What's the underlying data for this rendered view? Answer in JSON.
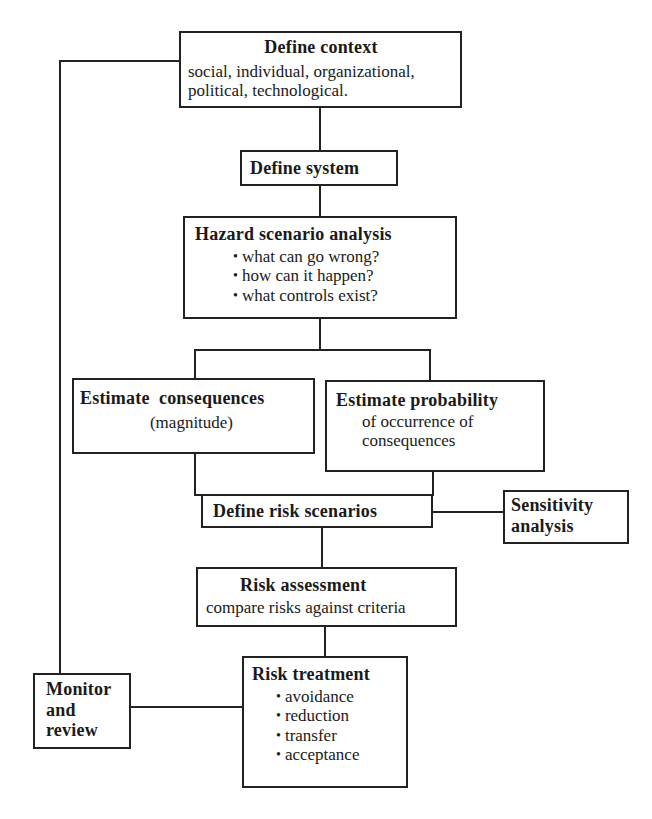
{
  "diagram": {
    "type": "flowchart",
    "nodes": {
      "define_context": {
        "title": "Define context",
        "text_line1": "social, individual, organizational,",
        "text_line2": "political, technological."
      },
      "define_system": {
        "title": "Define system"
      },
      "hazard_analysis": {
        "title": "Hazard scenario analysis",
        "bullets": [
          "what can go wrong?",
          "how can it happen?",
          "what controls exist?"
        ]
      },
      "estimate_consequences": {
        "title": "Estimate  consequences",
        "text": "(magnitude)"
      },
      "estimate_probability": {
        "title": "Estimate probability",
        "text_line1": "of occurrence of",
        "text_line2": "consequences"
      },
      "define_risk_scenarios": {
        "title": "Define risk scenarios"
      },
      "sensitivity_analysis": {
        "title_line1": "Sensitivity",
        "title_line2": "analysis"
      },
      "risk_assessment": {
        "title": "Risk assessment",
        "text": "compare risks against criteria"
      },
      "risk_treatment": {
        "title": "Risk treatment",
        "bullets": [
          "avoidance",
          "reduction",
          "transfer",
          "acceptance"
        ]
      },
      "monitor_review": {
        "title_line1": "Monitor",
        "title_line2": "and",
        "title_line3": "review"
      }
    },
    "edges": [
      [
        "define_context",
        "define_system"
      ],
      [
        "define_system",
        "hazard_analysis"
      ],
      [
        "hazard_analysis",
        "estimate_consequences"
      ],
      [
        "hazard_analysis",
        "estimate_probability"
      ],
      [
        "estimate_consequences",
        "define_risk_scenarios"
      ],
      [
        "estimate_probability",
        "define_risk_scenarios"
      ],
      [
        "define_risk_scenarios",
        "sensitivity_analysis"
      ],
      [
        "define_risk_scenarios",
        "risk_assessment"
      ],
      [
        "risk_assessment",
        "risk_treatment"
      ],
      [
        "risk_treatment",
        "monitor_review"
      ],
      [
        "monitor_review",
        "define_context"
      ]
    ],
    "line_color": "#222222"
  }
}
